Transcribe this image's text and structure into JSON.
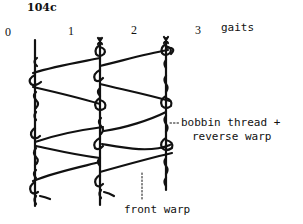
{
  "figure": {
    "label": "104c",
    "gait_numbers": [
      "0",
      "1",
      "2",
      "3"
    ],
    "gait_axis_label": "gaits",
    "annotations": {
      "bobbin_line1": "bobbin thread +",
      "bobbin_line2": "reverse warp",
      "front_warp": "front warp"
    },
    "colors": {
      "ink": "#111111",
      "background": "#ffffff"
    }
  }
}
